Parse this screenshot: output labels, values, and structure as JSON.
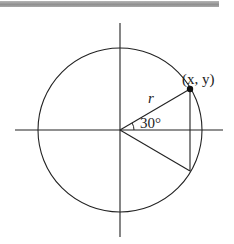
{
  "diagram": {
    "colors": {
      "stroke": "#222222",
      "top_bar": "#9a9a9a",
      "background": "#ffffff"
    },
    "center": {
      "x": 120,
      "y": 130
    },
    "radius": 82,
    "angle_deg": 30,
    "labels": {
      "point": "(x, y)",
      "radius": "r",
      "angle": "30°"
    }
  }
}
